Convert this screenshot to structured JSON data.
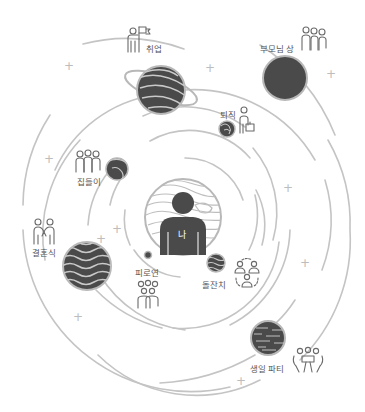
{
  "diagram": {
    "title": "",
    "center": {
      "label": "나",
      "description": "person silhouette in center planet"
    },
    "events": [
      {
        "id": "job",
        "label": "취업",
        "icon": "person-with-flag-icon"
      },
      {
        "id": "parents-funeral",
        "label": "부모님 상",
        "icon": "three-people-icon"
      },
      {
        "id": "retirement",
        "label": "퇴직",
        "icon": "person-with-briefcase-icon"
      },
      {
        "id": "housewarming",
        "label": "집들이",
        "icon": "group-people-icon"
      },
      {
        "id": "wedding",
        "label": "결혼식",
        "icon": "couple-icon"
      },
      {
        "id": "reception",
        "label": "피로연",
        "icon": "crowd-icon"
      },
      {
        "id": "first-birthday",
        "label": "돌잔치",
        "icon": "network-people-icon"
      },
      {
        "id": "birthday-party",
        "label": "생일 파티",
        "icon": "people-at-table-icon"
      }
    ],
    "colors": {
      "planet": "#4a4a4a",
      "planet_stroke": "#b8b8b8",
      "orbit": "#c4c4c4",
      "icon": "#6a6a6a",
      "text": "#555555",
      "plus": "#bdbdbd"
    }
  }
}
